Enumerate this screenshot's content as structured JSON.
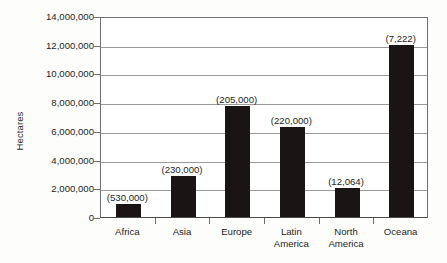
{
  "chart_data": {
    "type": "bar",
    "title": "",
    "xlabel": "",
    "ylabel": "Hectares",
    "ylim": [
      0,
      14000000
    ],
    "grid": true,
    "legend": "none",
    "categories": [
      "Africa",
      "Asia",
      "Europe",
      "Latin\nAmerica",
      "North\nAmerica",
      "Oceana"
    ],
    "values": [
      900000,
      2850000,
      7700000,
      6300000,
      2000000,
      12000000
    ],
    "annotations": [
      "(530,000)",
      "(230,000)",
      "(205,000)",
      "(220,000)",
      "(12,064)",
      "(7,222)"
    ],
    "ytick_labels": [
      "14,000,000",
      "12,000,000",
      "10,000,000",
      "8,000,000",
      "6,000,000",
      "4,000,000",
      "2,000,000",
      "0"
    ],
    "ytick_values": [
      14000000,
      12000000,
      10000000,
      8000000,
      6000000,
      4000000,
      2000000,
      0
    ],
    "bar_color": "#1a1414",
    "grid_color": "#9a9a9a",
    "axis_color": "#6f6f6f",
    "background_color": "#ffffff"
  }
}
